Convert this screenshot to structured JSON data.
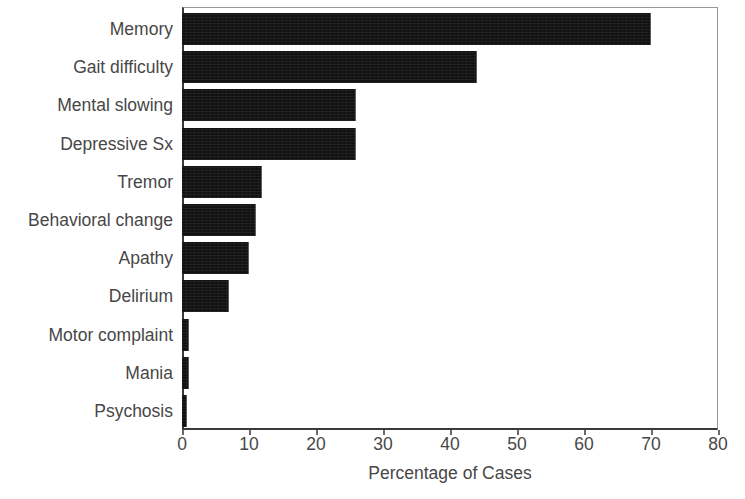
{
  "chart_data": {
    "type": "bar",
    "orientation": "horizontal",
    "title": "",
    "xlabel": "Percentage of Cases",
    "ylabel": "",
    "xlim": [
      0,
      80
    ],
    "xticks": [
      0,
      10,
      20,
      30,
      40,
      50,
      60,
      70,
      80
    ],
    "grid": false,
    "legend": null,
    "bar_color": "#111111",
    "text_color": "#474747",
    "axis_color": "#3a3a3a",
    "categories": [
      "Memory",
      "Gait difficulty",
      "Mental slowing",
      "Depressive Sx",
      "Tremor",
      "Behavioral change",
      "Apathy",
      "Delirium",
      "Motor complaint",
      "Mania",
      "Psychosis"
    ],
    "values": [
      70,
      44,
      26,
      26,
      12,
      11,
      10,
      7,
      1,
      1,
      0.8
    ]
  }
}
